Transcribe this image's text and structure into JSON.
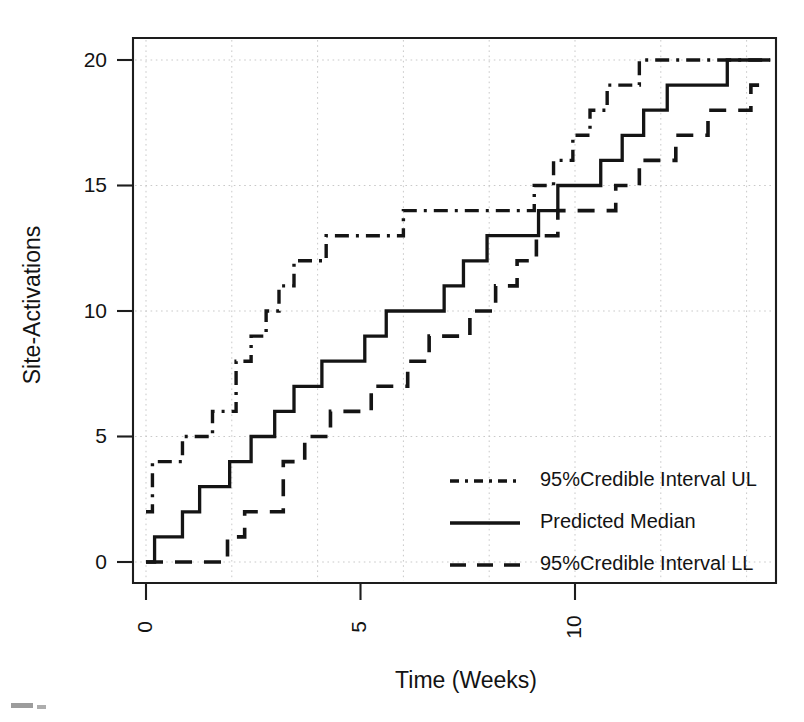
{
  "chart_data": {
    "type": "line",
    "subtype": "step",
    "title": "",
    "xlabel": "Time (Weeks)",
    "ylabel": "Site-Activations",
    "xlim": [
      -0.35,
      14.7
    ],
    "ylim": [
      -0.55,
      20.8
    ],
    "xticks": [
      0,
      5,
      10
    ],
    "xtick_labels": [
      "0",
      "5",
      "10"
    ],
    "yticks": [
      0,
      5,
      10,
      15,
      20
    ],
    "ytick_labels": [
      "0",
      "5",
      "10",
      "15",
      "20"
    ],
    "grid": true,
    "grid_style": "dotted",
    "grid_color": "#c9c9c9",
    "legend_position": "center-right-inside",
    "line_color": "#141414",
    "background": "#ffffff",
    "series": [
      {
        "name": "95%Credible Interval UL",
        "linestyle": "dashdot",
        "key": "ul",
        "x": [
          0.0,
          0.15,
          0.15,
          0.85,
          0.85,
          1.55,
          1.55,
          2.1,
          2.1,
          2.45,
          2.45,
          2.8,
          2.8,
          3.1,
          3.1,
          3.45,
          3.45,
          3.8,
          3.8,
          4.2,
          4.2,
          4.75,
          4.75,
          5.5,
          5.5,
          6.0,
          6.0,
          6.55,
          6.55,
          9.05,
          9.05,
          9.5,
          9.5,
          9.95,
          9.95,
          10.35,
          10.35,
          10.75,
          10.75,
          11.15,
          11.15,
          11.5,
          11.5,
          14.55
        ],
        "y": [
          2,
          2,
          4,
          4,
          5,
          5,
          6,
          6,
          8,
          8,
          9,
          9,
          10,
          10,
          11,
          11,
          12,
          12,
          12,
          12,
          13,
          13,
          13,
          13,
          13,
          13,
          14,
          14,
          14,
          14,
          15,
          15,
          16,
          16,
          17,
          17,
          18,
          18,
          19,
          19,
          19,
          19,
          20,
          20
        ]
      },
      {
        "name": "Predicted Median",
        "linestyle": "solid",
        "key": "median",
        "x": [
          0.0,
          0.2,
          0.2,
          0.85,
          0.85,
          1.25,
          1.25,
          1.95,
          1.95,
          2.45,
          2.45,
          3.0,
          3.0,
          3.45,
          3.45,
          4.1,
          4.1,
          4.6,
          4.6,
          5.1,
          5.1,
          5.6,
          5.6,
          6.15,
          6.15,
          6.95,
          6.95,
          7.4,
          7.4,
          7.95,
          7.95,
          8.55,
          8.55,
          9.15,
          9.15,
          9.6,
          9.6,
          10.6,
          10.6,
          11.1,
          11.1,
          11.6,
          11.6,
          12.15,
          12.15,
          12.65,
          12.65,
          13.15,
          13.15,
          13.55,
          13.55,
          14.55
        ],
        "y": [
          0,
          0,
          1,
          1,
          2,
          2,
          3,
          3,
          4,
          4,
          5,
          5,
          6,
          6,
          7,
          7,
          8,
          8,
          8,
          8,
          9,
          9,
          10,
          10,
          10,
          10,
          11,
          11,
          12,
          12,
          13,
          13,
          13,
          13,
          14,
          14,
          15,
          15,
          16,
          16,
          17,
          17,
          18,
          18,
          19,
          19,
          19,
          19,
          19,
          19,
          20,
          20
        ]
      },
      {
        "name": "95%Credible Interval LL",
        "linestyle": "dashed",
        "key": "ll",
        "x": [
          0.0,
          1.9,
          1.9,
          2.3,
          2.3,
          3.2,
          3.2,
          3.7,
          3.7,
          4.3,
          4.3,
          5.25,
          5.25,
          6.1,
          6.1,
          6.6,
          6.6,
          7.55,
          7.55,
          8.15,
          8.15,
          8.65,
          8.65,
          9.1,
          9.1,
          9.6,
          9.6,
          10.05,
          10.05,
          10.95,
          10.95,
          11.5,
          11.5,
          12.35,
          12.35,
          13.1,
          13.1,
          14.1,
          14.1,
          14.55
        ],
        "y": [
          0,
          0,
          1,
          1,
          2,
          2,
          4,
          4,
          5,
          5,
          6,
          6,
          7,
          7,
          8,
          8,
          9,
          9,
          10,
          10,
          11,
          11,
          12,
          12,
          13,
          13,
          14,
          14,
          14,
          14,
          15,
          15,
          16,
          16,
          17,
          17,
          18,
          18,
          19,
          19
        ]
      }
    ],
    "legend_entries": [
      {
        "label": "95%Credible Interval UL",
        "key": "ul"
      },
      {
        "label": "Predicted Median",
        "key": "median"
      },
      {
        "label": "95%Credible Interval LL",
        "key": "ll"
      }
    ]
  }
}
